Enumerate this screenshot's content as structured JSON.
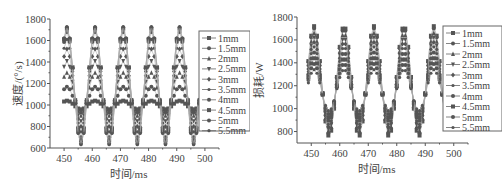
{
  "chart_data": [
    {
      "type": "line",
      "title": "",
      "xlabel": "时间/ms",
      "ylabel": "速度/(°/s)",
      "xlim": [
        445,
        505
      ],
      "ylim": [
        600,
        1800
      ],
      "xticks": [
        450,
        460,
        470,
        480,
        490,
        500
      ],
      "yticks": [
        600,
        800,
        1000,
        1200,
        1400,
        1600,
        1800
      ],
      "grid": false,
      "legend_position": "right",
      "period_ms": 10,
      "x": [
        450,
        451,
        452,
        453,
        454,
        455,
        456,
        457,
        458,
        459,
        460,
        461,
        462,
        463,
        464,
        465,
        466,
        467,
        468,
        469,
        470,
        471,
        472,
        473,
        474,
        475,
        476,
        477,
        478,
        479,
        480,
        481,
        482,
        483,
        484,
        485,
        486,
        487,
        488,
        489,
        490,
        491,
        492,
        493,
        494,
        495,
        496,
        497,
        498
      ],
      "series": [
        {
          "name": "1mm",
          "center": 1000,
          "amplitude": 40
        },
        {
          "name": "1.5mm",
          "center": 1050,
          "amplitude": 120
        },
        {
          "name": "2mm",
          "center": 1100,
          "amplitude": 200
        },
        {
          "name": "2.5mm",
          "center": 1130,
          "amplitude": 280
        },
        {
          "name": "3mm",
          "center": 1160,
          "amplitude": 360
        },
        {
          "name": "3.5mm",
          "center": 1180,
          "amplitude": 430
        },
        {
          "name": "4mm",
          "center": 1190,
          "amplitude": 490
        },
        {
          "name": "4.5mm",
          "center": 1190,
          "amplitude": 520
        },
        {
          "name": "5mm",
          "center": 1180,
          "amplitude": 540
        },
        {
          "name": "5.5mm",
          "center": 1180,
          "amplitude": 550
        }
      ],
      "peaks_approx": {
        "max": 1730,
        "min": 630,
        "peak_times": [
          451,
          461,
          471,
          481,
          491
        ],
        "trough_times": [
          456,
          466,
          476,
          486,
          496
        ]
      }
    },
    {
      "type": "line",
      "title": "",
      "xlabel": "时间/ms",
      "ylabel": "损耗/W",
      "xlim": [
        445,
        505
      ],
      "ylim": [
        700,
        1800
      ],
      "xticks": [
        450,
        460,
        470,
        480,
        490,
        500
      ],
      "yticks": [
        800,
        1000,
        1200,
        1400,
        1600,
        1800
      ],
      "grid": false,
      "legend_position": "right",
      "period_ms": 10.5,
      "x": [
        449,
        450,
        451,
        452,
        453,
        454,
        455,
        456,
        457,
        458,
        459,
        460,
        461,
        462,
        463,
        464,
        465,
        466,
        467,
        468,
        469,
        470,
        471,
        472,
        473,
        474,
        475,
        476,
        477,
        478,
        479,
        480,
        481,
        482,
        483,
        484,
        485,
        486,
        487,
        488,
        489,
        490,
        491,
        492,
        493,
        494,
        495,
        496,
        497
      ],
      "series": [
        {
          "name": "1mm",
          "center": 1240,
          "amplitude": 480
        },
        {
          "name": "1.5mm",
          "center": 1240,
          "amplitude": 460
        },
        {
          "name": "2mm",
          "center": 1230,
          "amplitude": 430
        },
        {
          "name": "2.5mm",
          "center": 1220,
          "amplitude": 400
        },
        {
          "name": "3mm",
          "center": 1210,
          "amplitude": 370
        },
        {
          "name": "3.5mm",
          "center": 1200,
          "amplitude": 340
        },
        {
          "name": "4mm",
          "center": 1190,
          "amplitude": 300
        },
        {
          "name": "4.5mm",
          "center": 1180,
          "amplitude": 260
        },
        {
          "name": "5mm",
          "center": 1170,
          "amplitude": 220
        },
        {
          "name": "5.5mm",
          "center": 1160,
          "amplitude": 180
        }
      ],
      "peaks_approx": {
        "max": 1740,
        "min": 760,
        "peak_times": [
          451,
          462,
          472,
          483,
          493
        ],
        "trough_times": [
          457,
          467,
          478,
          488,
          498
        ]
      }
    }
  ],
  "left": {
    "ylabel": "速度/(°/s)",
    "xlabel": "时间/ms",
    "yticks": [
      "1800",
      "1600",
      "1400",
      "1200",
      "1000",
      "800",
      "600"
    ],
    "xticks": [
      "450",
      "460",
      "470",
      "480",
      "490",
      "500"
    ],
    "legend": [
      "1mm",
      "1.5mm",
      "2mm",
      "2.5mm",
      "3mm",
      "3.5mm",
      "4mm",
      "4.5mm",
      "5mm",
      "5.5mm"
    ]
  },
  "right": {
    "ylabel": "损耗/W",
    "xlabel": "时间/ms",
    "yticks": [
      "1800",
      "1600",
      "1400",
      "1200",
      "1000",
      "800"
    ],
    "xticks": [
      "450",
      "460",
      "470",
      "480",
      "490",
      "500"
    ],
    "legend": [
      "1mm",
      "1.5mm",
      "2mm",
      "2.5mm",
      "3mm",
      "3.5mm",
      "4mm",
      "4.5mm",
      "5mm",
      "5.5mm"
    ]
  },
  "colors": {
    "marker": "#555555",
    "line": "#aaaaaa",
    "axis": "#555555"
  }
}
